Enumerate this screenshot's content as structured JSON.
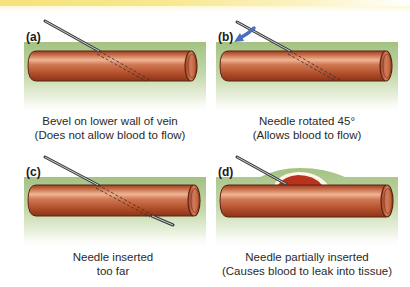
{
  "figure": {
    "panels": [
      {
        "id": "a",
        "label": "(a)",
        "caption_line1": "Bevel on lower wall of vein",
        "caption_line2": "(Does not allow blood to flow)"
      },
      {
        "id": "b",
        "label": "(b)",
        "caption_line1": "Needle rotated 45°",
        "caption_line2": "(Allows blood to flow)"
      },
      {
        "id": "c",
        "label": "(c)",
        "caption_line1": "Needle inserted",
        "caption_line2": "too far"
      },
      {
        "id": "d",
        "label": "(d)",
        "caption_line1": "Needle partially inserted",
        "caption_line2": "(Causes blood to leak into tissue)"
      }
    ],
    "colors": {
      "vein": "#b5532e",
      "vein_highlight": "#e8a88a",
      "vein_outline": "#5a2414",
      "tissue": "#a9c68a",
      "blood": "#b8321c",
      "needle": "#5e5e5e",
      "arrow": "#4a6fc0",
      "top_bar": "#f5e27a"
    },
    "icons": {
      "rotation_arrow": "arrow-down-left-icon"
    }
  }
}
